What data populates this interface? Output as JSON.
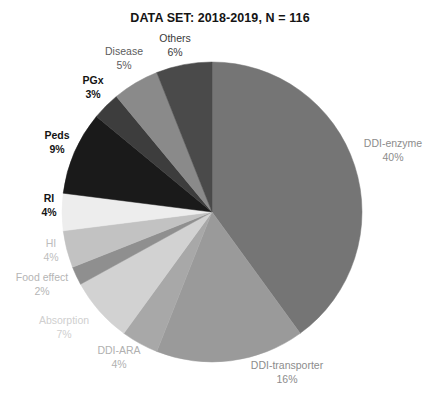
{
  "chart": {
    "title": "DATA SET: 2018-2019, N = 116"
  },
  "chart_data": {
    "type": "pie",
    "title": "DATA SET: 2018-2019, N = 116",
    "xlabel": "",
    "ylabel": "",
    "legend_position": "none",
    "grid": false,
    "units": "percent",
    "total_n": 116,
    "start_angle_deg": 0,
    "direction": "clockwise",
    "labels": [
      "DDI-enzyme",
      "DDI-transporter",
      "DDI-ARA",
      "Absorption",
      "Food effect",
      "HI",
      "RI",
      "Peds",
      "PGx",
      "Disease",
      "Others"
    ],
    "values": [
      40,
      16,
      4,
      7,
      2,
      4,
      4,
      9,
      3,
      5,
      6
    ],
    "value_labels": [
      "40%",
      "16%",
      "4%",
      "7%",
      "2%",
      "4%",
      "4%",
      "9%",
      "3%",
      "5%",
      "6%"
    ],
    "colors": [
      "#757575",
      "#9a9a9a",
      "#a8a8a8",
      "#d2d2d2",
      "#8f8f8f",
      "#c2c2c2",
      "#ededed",
      "#1a1a1a",
      "#3d3d3d",
      "#8a8a8a",
      "#4a4a4a"
    ],
    "slices": [
      {
        "label": "DDI-enzyme",
        "value": 40,
        "value_label": "40%",
        "color": "#757575",
        "text_color": "#8c8c8c",
        "bold": false,
        "label_x": 393,
        "label_y": 150
      },
      {
        "label": "DDI-transporter",
        "value": 16,
        "value_label": "16%",
        "color": "#9a9a9a",
        "text_color": "#8c8c8c",
        "bold": false,
        "label_x": 287,
        "label_y": 372
      },
      {
        "label": "DDI-ARA",
        "value": 4,
        "value_label": "4%",
        "color": "#a8a8a8",
        "text_color": "#b0b0b0",
        "bold": false,
        "label_x": 119,
        "label_y": 357
      },
      {
        "label": "Absorption",
        "value": 7,
        "value_label": "7%",
        "color": "#d2d2d2",
        "text_color": "#cfcfcf",
        "bold": false,
        "label_x": 64,
        "label_y": 327
      },
      {
        "label": "Food effect",
        "value": 2,
        "value_label": "2%",
        "color": "#8f8f8f",
        "text_color": "#b5b5b5",
        "bold": false,
        "label_x": 42,
        "label_y": 284
      },
      {
        "label": "HI",
        "value": 4,
        "value_label": "4%",
        "color": "#c2c2c2",
        "text_color": "#bdbdbd",
        "bold": false,
        "label_x": 51,
        "label_y": 250
      },
      {
        "label": "RI",
        "value": 4,
        "value_label": "4%",
        "color": "#ededed",
        "text_color": "#141414",
        "bold": true,
        "label_x": 49,
        "label_y": 205
      },
      {
        "label": "Peds",
        "value": 9,
        "value_label": "9%",
        "color": "#1a1a1a",
        "text_color": "#141414",
        "bold": true,
        "label_x": 57,
        "label_y": 142
      },
      {
        "label": "PGx",
        "value": 3,
        "value_label": "3%",
        "color": "#3d3d3d",
        "text_color": "#141414",
        "bold": true,
        "label_x": 93,
        "label_y": 87
      },
      {
        "label": "Disease",
        "value": 5,
        "value_label": "5%",
        "color": "#8a8a8a",
        "text_color": "#5c5c5c",
        "bold": false,
        "label_x": 124,
        "label_y": 58
      },
      {
        "label": "Others",
        "value": 6,
        "value_label": "6%",
        "color": "#4a4a4a",
        "text_color": "#3a3a3a",
        "bold": false,
        "label_x": 175,
        "label_y": 45
      }
    ],
    "geometry": {
      "center_x": 212,
      "center_y": 212,
      "radius": 150
    }
  }
}
